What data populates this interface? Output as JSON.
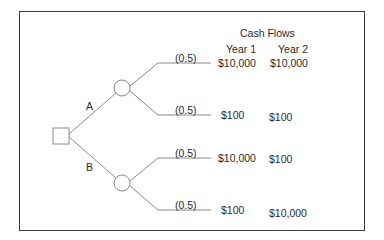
{
  "header": {
    "title": "Cash Flows",
    "columns": [
      "Year 1",
      "Year 2"
    ]
  },
  "decisions": [
    {
      "label": "A"
    },
    {
      "label": "B"
    }
  ],
  "outcomes": [
    {
      "decision": "A",
      "probability": "(0.5)",
      "year1": "$10,000",
      "year2": "$10,000"
    },
    {
      "decision": "A",
      "probability": "(0.5)",
      "year1": "$100",
      "year2": "$100"
    },
    {
      "decision": "B",
      "probability": "(0.5)",
      "year1": "$10,000",
      "year2": "$100"
    },
    {
      "decision": "B",
      "probability": "(0.5)",
      "year1": "$100",
      "year2": "$10,000"
    }
  ],
  "colors": {
    "line": "#8a8a8a",
    "frame": "#3c3c3c",
    "text": "#2a2a2a"
  }
}
